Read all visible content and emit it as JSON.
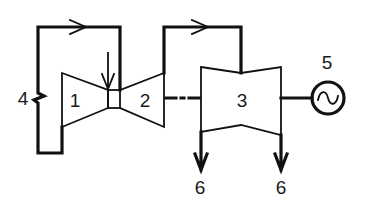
{
  "diagram": {
    "type": "combined cycle schematic",
    "colors": {
      "line": "#111111",
      "background": "#ffffff"
    },
    "components": [
      {
        "id": "1",
        "label": "1",
        "shape": "compressor (converging trapezoid)"
      },
      {
        "id": "2",
        "label": "2",
        "shape": "turbine (diverging trapezoid)"
      },
      {
        "id": "3",
        "label": "3",
        "shape": "double-flow turbine"
      },
      {
        "id": "4",
        "label": "4",
        "shape": "loop line with break symbol"
      },
      {
        "id": "5",
        "label": "5",
        "shape": "generator (circle with ~)"
      },
      {
        "id": "6a",
        "label": "6",
        "shape": "outlet arrow (down)"
      },
      {
        "id": "6b",
        "label": "6",
        "shape": "outlet arrow (down)"
      }
    ],
    "connections": [
      {
        "from": "2",
        "to": "1",
        "path": "top loop with right-pointing arrow and break 4"
      },
      {
        "from": "2",
        "to": "3",
        "path": "top pipe with right-pointing arrow"
      },
      {
        "from": "2",
        "to": "3",
        "path": "dash-dot shaft"
      },
      {
        "from": "3",
        "to": "5",
        "path": "shaft"
      }
    ],
    "labels": {
      "c1": "1",
      "c2": "2",
      "c3": "3",
      "c4": "4",
      "c5": "5",
      "c6a": "6",
      "c6b": "6",
      "generator_symbol": "~"
    }
  }
}
